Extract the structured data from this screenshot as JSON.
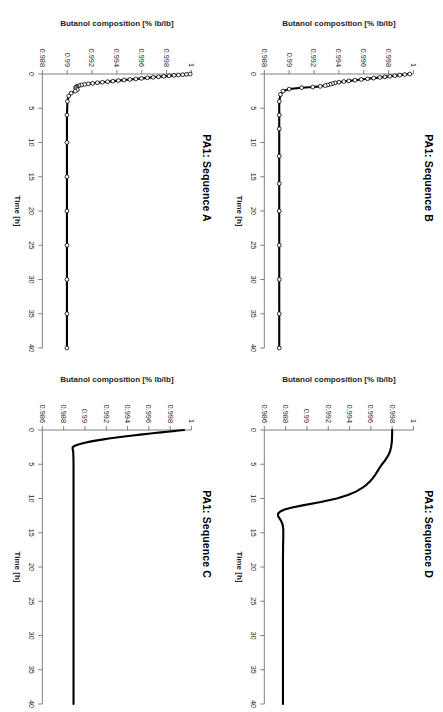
{
  "figure": {
    "rotation_deg": 90,
    "panel_order": [
      "B",
      "D",
      "A",
      "C"
    ],
    "line_color": "#000000",
    "axis_color": "#808080",
    "text_color": "#262626"
  },
  "chart_data": [
    {
      "id": "panel-b",
      "type": "line",
      "title": "PA1: Sequence B",
      "xlabel": "Time [h]",
      "ylabel": "Butanol composition [% lb/lb]",
      "xlim": [
        0,
        40
      ],
      "ylim": [
        0.988,
        1
      ],
      "xticks": [
        0,
        5,
        10,
        15,
        20,
        25,
        30,
        35,
        40
      ],
      "xticklabels": [
        "0",
        "5",
        "10",
        "15",
        "20",
        "25",
        "30",
        "35",
        "40"
      ],
      "yticks": [
        0.988,
        0.99,
        0.992,
        0.994,
        0.996,
        0.998,
        1
      ],
      "yticklabels": [
        "0.988",
        "0.99",
        "0.992",
        "0.994",
        "0.996",
        "0.998",
        "1"
      ],
      "grid": false,
      "legend": null,
      "markers": "open-circle",
      "series": [
        {
          "name": "Butanol composition",
          "x": [
            0,
            0.08,
            0.16,
            0.25,
            0.33,
            0.42,
            0.5,
            0.6,
            0.7,
            0.8,
            0.9,
            1.0,
            1.1,
            1.2,
            1.3,
            1.4,
            1.5,
            1.6,
            1.7,
            1.8,
            1.9,
            2.0,
            2.2,
            2.5,
            3,
            4,
            6,
            8,
            12,
            16,
            20,
            25,
            30,
            35,
            40
          ],
          "y": [
            0.9997,
            0.9993,
            0.9989,
            0.9985,
            0.9981,
            0.9977,
            0.9973,
            0.9968,
            0.9963,
            0.9958,
            0.9953,
            0.9948,
            0.9944,
            0.994,
            0.9937,
            0.9935,
            0.9933,
            0.9931,
            0.9929,
            0.9925,
            0.9919,
            0.991,
            0.99,
            0.9895,
            0.9893,
            0.9892,
            0.9892,
            0.9892,
            0.9892,
            0.9892,
            0.9892,
            0.9892,
            0.9892,
            0.9892,
            0.9892
          ]
        }
      ]
    },
    {
      "id": "panel-d",
      "type": "line",
      "title": "PA1: Sequence D",
      "xlabel": "Time [h]",
      "ylabel": "Butanol composition [% lb/lb]",
      "xlim": [
        0,
        40
      ],
      "ylim": [
        0.986,
        1
      ],
      "xticks": [
        0,
        5,
        10,
        15,
        20,
        25,
        30,
        35,
        40
      ],
      "xticklabels": [
        "0",
        "5",
        "10",
        "15",
        "20",
        "25",
        "30",
        "35",
        "40"
      ],
      "yticks": [
        0.986,
        0.988,
        0.99,
        0.992,
        0.994,
        0.996,
        0.998,
        1
      ],
      "yticklabels": [
        "0.986",
        "0.988",
        "0.99",
        "0.992",
        "0.994",
        "0.996",
        "0.998",
        "1"
      ],
      "grid": false,
      "legend": null,
      "markers": "none",
      "series": [
        {
          "name": "Butanol composition",
          "x": [
            0,
            0.5,
            1,
            1.5,
            2,
            2.5,
            3,
            3.5,
            4,
            4.5,
            5,
            5.5,
            6,
            6.5,
            7,
            7.5,
            8,
            8.5,
            9,
            9.5,
            10,
            10.5,
            11,
            11.3,
            11.6,
            11.9,
            12.2,
            12.5,
            12.8,
            13.2,
            13.8,
            14.5,
            15.5,
            17,
            19,
            21,
            24,
            28,
            32,
            36,
            40
          ],
          "y": [
            0.998,
            0.998,
            0.99799,
            0.99798,
            0.99795,
            0.9979,
            0.99782,
            0.9977,
            0.99752,
            0.9973,
            0.99705,
            0.99683,
            0.99663,
            0.99643,
            0.9962,
            0.99592,
            0.99558,
            0.99515,
            0.9946,
            0.99385,
            0.9928,
            0.9913,
            0.9896,
            0.9886,
            0.9879,
            0.9875,
            0.9873,
            0.98728,
            0.98738,
            0.98755,
            0.98772,
            0.98778,
            0.98778,
            0.98776,
            0.98775,
            0.98775,
            0.98775,
            0.98775,
            0.98775,
            0.98775,
            0.98775
          ]
        }
      ]
    },
    {
      "id": "panel-a",
      "type": "line",
      "title": "PA1: Sequence A",
      "xlabel": "Time [h]",
      "ylabel": "Butanol composition [% lb/lb]",
      "xlim": [
        0,
        40
      ],
      "ylim": [
        0.988,
        1
      ],
      "xticks": [
        0,
        5,
        10,
        15,
        20,
        25,
        30,
        35,
        40
      ],
      "xticklabels": [
        "0",
        "5",
        "10",
        "15",
        "20",
        "25",
        "30",
        "35",
        "40"
      ],
      "yticks": [
        0.988,
        0.99,
        0.992,
        0.994,
        0.996,
        0.998,
        1
      ],
      "yticklabels": [
        "0.988",
        "0.99",
        "0.992",
        "0.994",
        "0.996",
        "0.998",
        "1"
      ],
      "grid": false,
      "legend": null,
      "markers": "open-circle",
      "series": [
        {
          "name": "Butanol composition",
          "x": [
            0,
            0.05,
            0.1,
            0.15,
            0.2,
            0.27,
            0.34,
            0.41,
            0.48,
            0.56,
            0.64,
            0.72,
            0.8,
            0.88,
            0.96,
            1.04,
            1.12,
            1.2,
            1.28,
            1.36,
            1.44,
            1.52,
            1.6,
            1.7,
            1.8,
            1.9,
            2.0,
            2.15,
            2.3,
            2.5,
            2.8,
            3.2,
            4,
            6,
            10,
            15,
            20,
            25,
            30,
            35,
            40
          ],
          "y": [
            0.9999,
            0.9996,
            0.9993,
            0.99895,
            0.9986,
            0.9982,
            0.99778,
            0.99735,
            0.99692,
            0.99645,
            0.99598,
            0.99552,
            0.99505,
            0.99458,
            0.99412,
            0.99368,
            0.99325,
            0.99283,
            0.99243,
            0.99205,
            0.9917,
            0.9914,
            0.99115,
            0.99095,
            0.9908,
            0.99072,
            0.99068,
            0.99072,
            0.99082,
            0.99065,
            0.99032,
            0.99012,
            0.99002,
            0.98998,
            0.98998,
            0.98998,
            0.98998,
            0.98998,
            0.98998,
            0.98998,
            0.98998
          ]
        }
      ]
    },
    {
      "id": "panel-c",
      "type": "line",
      "title": "PA1: Sequence C",
      "xlabel": "Time [h]",
      "ylabel": "Butanol composition [% lb/lb]",
      "xlim": [
        0,
        40
      ],
      "ylim": [
        0.986,
        1
      ],
      "xticks": [
        0,
        5,
        10,
        15,
        20,
        25,
        30,
        35,
        40
      ],
      "xticklabels": [
        "0",
        "5",
        "10",
        "15",
        "20",
        "25",
        "30",
        "35",
        "40"
      ],
      "yticks": [
        0.986,
        0.988,
        0.99,
        0.992,
        0.994,
        0.996,
        0.998,
        1
      ],
      "yticklabels": [
        "0.986",
        "0.988",
        "0.99",
        "0.992",
        "0.994",
        "0.996",
        "0.998",
        "1"
      ],
      "grid": false,
      "legend": null,
      "markers": "none",
      "series": [
        {
          "name": "Butanol composition",
          "x": [
            0,
            0.08,
            0.16,
            0.25,
            0.35,
            0.45,
            0.55,
            0.68,
            0.8,
            0.95,
            1.1,
            1.25,
            1.4,
            1.55,
            1.7,
            1.85,
            2.0,
            2.15,
            2.3,
            2.5,
            2.8,
            3.2,
            4,
            5,
            7,
            10,
            14,
            18,
            22,
            26,
            30,
            34,
            40
          ],
          "y": [
            0.9993,
            0.9988,
            0.9983,
            0.99775,
            0.99715,
            0.99655,
            0.99595,
            0.9952,
            0.9945,
            0.9937,
            0.99295,
            0.99225,
            0.9916,
            0.991,
            0.99048,
            0.99,
            0.98962,
            0.9893,
            0.98905,
            0.98885,
            0.98885,
            0.9889,
            0.98892,
            0.98893,
            0.98893,
            0.98893,
            0.98893,
            0.98893,
            0.98893,
            0.98893,
            0.98893,
            0.98893,
            0.98893
          ]
        }
      ]
    }
  ]
}
